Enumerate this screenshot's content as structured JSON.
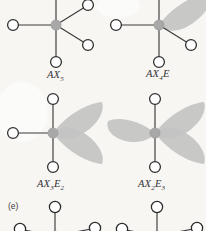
{
  "figure": {
    "panel_label": "(e)",
    "background_color": "#f7f6f3",
    "center_atom_color": "#a8a8a8",
    "lone_pair_color": "#c3c3c3",
    "ligand_fill_color": "#ffffff",
    "bond_color": "#3a3a3a"
  },
  "diagrams": [
    {
      "id": "ax5",
      "label_main": "AX",
      "label_sub1": "5",
      "label_rest": "",
      "label_sub2": "",
      "full_label": "AX5",
      "ligand_count": 5,
      "lone_pair_count": 0,
      "geometry": "trigonal bipyramidal"
    },
    {
      "id": "ax4e",
      "label_main": "AX",
      "label_sub1": "4",
      "label_rest": "E",
      "label_sub2": "",
      "full_label": "AX4E",
      "ligand_count": 4,
      "lone_pair_count": 1,
      "geometry": "seesaw"
    },
    {
      "id": "ax3e2",
      "label_main": "AX",
      "label_sub1": "3",
      "label_rest": "E",
      "label_sub2": "2",
      "full_label": "AX3E2",
      "ligand_count": 3,
      "lone_pair_count": 2,
      "geometry": "T-shaped"
    },
    {
      "id": "ax2e3",
      "label_main": "AX",
      "label_sub1": "2",
      "label_rest": "E",
      "label_sub2": "3",
      "full_label": "AX2E3",
      "ligand_count": 2,
      "lone_pair_count": 3,
      "geometry": "linear"
    }
  ]
}
